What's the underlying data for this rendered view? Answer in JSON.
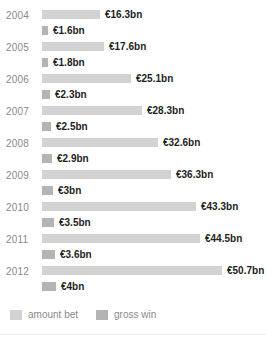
{
  "chart_data": {
    "type": "bar",
    "orientation": "horizontal",
    "title": "",
    "subtitle": "",
    "xlabel": "",
    "ylabel": "",
    "grid": false,
    "legend_position": "bottom-left",
    "unit": "€bn",
    "xlim": [
      0,
      50.7
    ],
    "px_per_unit": 3.55,
    "categories": [
      "2004",
      "2005",
      "2006",
      "2007",
      "2008",
      "2009",
      "2010",
      "2011",
      "2012"
    ],
    "series": [
      {
        "name": "amount bet",
        "color": "#d2d2d2",
        "values": [
          16.3,
          17.6,
          25.1,
          28.3,
          32.6,
          36.3,
          43.3,
          44.5,
          50.7
        ],
        "labels": [
          "€16.3bn",
          "€17.6bn",
          "€25.1bn",
          "€28.3bn",
          "€32.6bn",
          "€36.3bn",
          "€43.3bn",
          "€44.5bn",
          "€50.7bn"
        ]
      },
      {
        "name": "gross win",
        "color": "#b4b4b4",
        "values": [
          1.6,
          1.8,
          2.3,
          2.5,
          2.9,
          3.0,
          3.5,
          3.6,
          4.0
        ],
        "labels": [
          "€1.6bn",
          "€1.8bn",
          "€2.3bn",
          "€2.5bn",
          "€2.9bn",
          "€3bn",
          "€3.5bn",
          "€3.6bn",
          "€4bn"
        ]
      }
    ]
  },
  "rows": [
    {
      "year": "2004",
      "bet": {
        "label": "€16.3bn",
        "width": 58
      },
      "win": {
        "label": "€1.6bn",
        "width": 6
      }
    },
    {
      "year": "2005",
      "bet": {
        "label": "€17.6bn",
        "width": 62
      },
      "win": {
        "label": "€1.8bn",
        "width": 6
      }
    },
    {
      "year": "2006",
      "bet": {
        "label": "€25.1bn",
        "width": 89
      },
      "win": {
        "label": "€2.3bn",
        "width": 8
      }
    },
    {
      "year": "2007",
      "bet": {
        "label": "€28.3bn",
        "width": 100
      },
      "win": {
        "label": "€2.5bn",
        "width": 9
      }
    },
    {
      "year": "2008",
      "bet": {
        "label": "€32.6bn",
        "width": 116
      },
      "win": {
        "label": "€2.9bn",
        "width": 10
      }
    },
    {
      "year": "2009",
      "bet": {
        "label": "€36.3bn",
        "width": 129
      },
      "win": {
        "label": "€3bn",
        "width": 11
      }
    },
    {
      "year": "2010",
      "bet": {
        "label": "€43.3bn",
        "width": 154
      },
      "win": {
        "label": "€3.5bn",
        "width": 12
      }
    },
    {
      "year": "2011",
      "bet": {
        "label": "€44.5bn",
        "width": 158
      },
      "win": {
        "label": "€3.6bn",
        "width": 13
      }
    },
    {
      "year": "2012",
      "bet": {
        "label": "€50.7bn",
        "width": 180
      },
      "win": {
        "label": "€4bn",
        "width": 14
      }
    }
  ],
  "legend": {
    "bet_label": "amount bet",
    "win_label": "gross win",
    "bet_color": "#d2d2d2",
    "win_color": "#b4b4b4"
  }
}
